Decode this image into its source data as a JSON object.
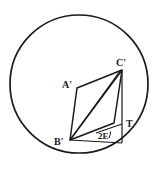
{
  "figure": {
    "background_color": "#ffffff",
    "stroke_color": "#1a1a1a",
    "circle": {
      "name": "outer-circle",
      "cx": 79,
      "cy": 84,
      "r": 69,
      "stroke_width": 1.6
    },
    "labels": {
      "a_prime": "A'",
      "c_prime": "C'",
      "b_prime": "B'",
      "t": "T",
      "angle_2e": "2E"
    },
    "points": {
      "a_prime": {
        "x": 77,
        "y": 88
      },
      "c_prime": {
        "x": 122,
        "y": 70
      },
      "b_prime": {
        "x": 70,
        "y": 140
      },
      "d_corner": {
        "x": 114,
        "y": 123
      },
      "t": {
        "x": 122,
        "y": 124
      },
      "foot": {
        "x": 122,
        "y": 143
      }
    },
    "segments": [
      {
        "name": "segment-a-prime-c-prime",
        "from": "a_prime",
        "to": "c_prime"
      },
      {
        "name": "segment-a-prime-b-prime",
        "from": "a_prime",
        "to": "b_prime"
      },
      {
        "name": "segment-b-prime-d-corner",
        "from": "b_prime",
        "to": "d_corner"
      },
      {
        "name": "segment-d-corner-c-prime",
        "from": "d_corner",
        "to": "c_prime"
      },
      {
        "name": "diagonal-b-prime-c-prime",
        "from": "b_prime",
        "to": "c_prime"
      },
      {
        "name": "vertical-c-prime-foot",
        "from": "c_prime",
        "to": "foot"
      },
      {
        "name": "baseline-b-prime-foot",
        "from": "b_prime",
        "to": "foot"
      }
    ],
    "angle_arc": {
      "name": "angle-arc-2e",
      "vertex_x": 113,
      "vertex_y": 133,
      "radius": 13
    }
  }
}
